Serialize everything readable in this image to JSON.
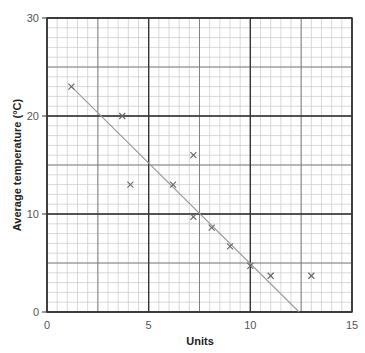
{
  "chart_data": {
    "type": "scatter",
    "title": "",
    "xlabel": "Units",
    "ylabel": "Average temperature (°C)",
    "xlim": [
      0,
      15
    ],
    "ylim": [
      0,
      30
    ],
    "x_ticks": [
      0,
      5,
      10,
      15
    ],
    "y_ticks": [
      0,
      10,
      20,
      30
    ],
    "grid": true,
    "legend": null,
    "series": [
      {
        "name": "observations",
        "marker": "x",
        "points": [
          {
            "x": 1.2,
            "y": 23.0
          },
          {
            "x": 3.7,
            "y": 20.0
          },
          {
            "x": 4.1,
            "y": 13.0
          },
          {
            "x": 6.2,
            "y": 13.0
          },
          {
            "x": 7.2,
            "y": 16.0
          },
          {
            "x": 7.2,
            "y": 9.7
          },
          {
            "x": 8.1,
            "y": 8.6
          },
          {
            "x": 9.0,
            "y": 6.7
          },
          {
            "x": 10.0,
            "y": 4.7
          },
          {
            "x": 11.0,
            "y": 3.7
          },
          {
            "x": 13.0,
            "y": 3.7
          }
        ]
      }
    ],
    "line_of_best_fit": {
      "x1": 1.2,
      "y1": 23.0,
      "x2": 12.4,
      "y2": 0.0
    },
    "colors": {
      "major_grid": "#333333",
      "mid_grid": "#777777",
      "minor_grid": "#c8c8c8",
      "marker": "#666666",
      "fit_line": "#999999"
    }
  }
}
